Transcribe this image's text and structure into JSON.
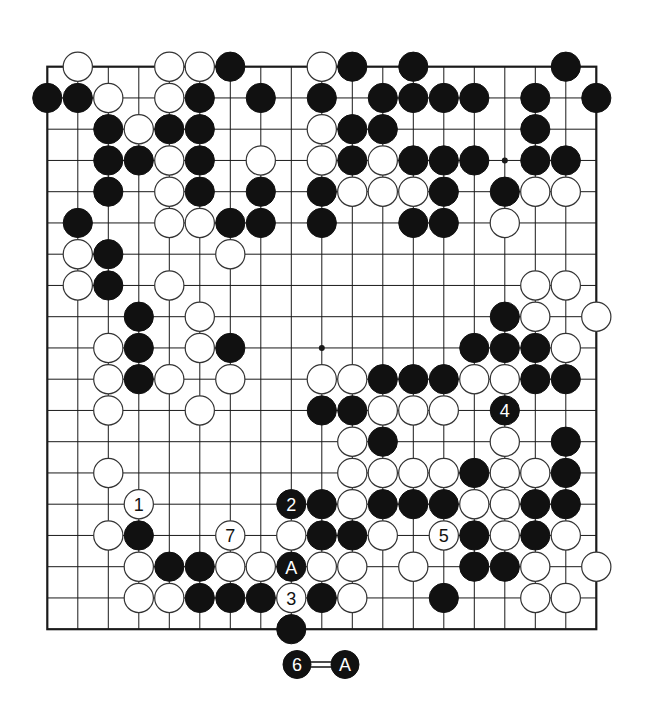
{
  "diagram": {
    "type": "go-board",
    "size": 19,
    "colors": {
      "black": "#111111",
      "white": "#ffffff",
      "line": "#1a1a1a",
      "background": "#ffffff"
    },
    "star_points": [
      [
        9,
        9
      ],
      [
        15,
        3
      ]
    ],
    "stones": [
      {
        "c": 1,
        "r": 0,
        "color": "W"
      },
      {
        "c": 4,
        "r": 0,
        "color": "W"
      },
      {
        "c": 5,
        "r": 0,
        "color": "W"
      },
      {
        "c": 6,
        "r": 0,
        "color": "B"
      },
      {
        "c": 9,
        "r": 0,
        "color": "W"
      },
      {
        "c": 10,
        "r": 0,
        "color": "B"
      },
      {
        "c": 12,
        "r": 0,
        "color": "B"
      },
      {
        "c": 17,
        "r": 0,
        "color": "B"
      },
      {
        "c": 0,
        "r": 1,
        "color": "B"
      },
      {
        "c": 1,
        "r": 1,
        "color": "B"
      },
      {
        "c": 2,
        "r": 1,
        "color": "W"
      },
      {
        "c": 4,
        "r": 1,
        "color": "W"
      },
      {
        "c": 5,
        "r": 1,
        "color": "B"
      },
      {
        "c": 7,
        "r": 1,
        "color": "B"
      },
      {
        "c": 9,
        "r": 1,
        "color": "B"
      },
      {
        "c": 11,
        "r": 1,
        "color": "B"
      },
      {
        "c": 12,
        "r": 1,
        "color": "B"
      },
      {
        "c": 13,
        "r": 1,
        "color": "B"
      },
      {
        "c": 14,
        "r": 1,
        "color": "B"
      },
      {
        "c": 16,
        "r": 1,
        "color": "B"
      },
      {
        "c": 18,
        "r": 1,
        "color": "B"
      },
      {
        "c": 2,
        "r": 2,
        "color": "B"
      },
      {
        "c": 3,
        "r": 2,
        "color": "W"
      },
      {
        "c": 4,
        "r": 2,
        "color": "B"
      },
      {
        "c": 5,
        "r": 2,
        "color": "B"
      },
      {
        "c": 9,
        "r": 2,
        "color": "W"
      },
      {
        "c": 10,
        "r": 2,
        "color": "B"
      },
      {
        "c": 11,
        "r": 2,
        "color": "B"
      },
      {
        "c": 16,
        "r": 2,
        "color": "B"
      },
      {
        "c": 2,
        "r": 3,
        "color": "B"
      },
      {
        "c": 3,
        "r": 3,
        "color": "B"
      },
      {
        "c": 4,
        "r": 3,
        "color": "W"
      },
      {
        "c": 5,
        "r": 3,
        "color": "B"
      },
      {
        "c": 7,
        "r": 3,
        "color": "W"
      },
      {
        "c": 9,
        "r": 3,
        "color": "W"
      },
      {
        "c": 10,
        "r": 3,
        "color": "B"
      },
      {
        "c": 11,
        "r": 3,
        "color": "W"
      },
      {
        "c": 12,
        "r": 3,
        "color": "B"
      },
      {
        "c": 13,
        "r": 3,
        "color": "B"
      },
      {
        "c": 14,
        "r": 3,
        "color": "B"
      },
      {
        "c": 16,
        "r": 3,
        "color": "B"
      },
      {
        "c": 17,
        "r": 3,
        "color": "B"
      },
      {
        "c": 2,
        "r": 4,
        "color": "B"
      },
      {
        "c": 4,
        "r": 4,
        "color": "W"
      },
      {
        "c": 5,
        "r": 4,
        "color": "B"
      },
      {
        "c": 7,
        "r": 4,
        "color": "B"
      },
      {
        "c": 9,
        "r": 4,
        "color": "B"
      },
      {
        "c": 10,
        "r": 4,
        "color": "W"
      },
      {
        "c": 11,
        "r": 4,
        "color": "W"
      },
      {
        "c": 12,
        "r": 4,
        "color": "W"
      },
      {
        "c": 13,
        "r": 4,
        "color": "B"
      },
      {
        "c": 15,
        "r": 4,
        "color": "B"
      },
      {
        "c": 16,
        "r": 4,
        "color": "W"
      },
      {
        "c": 17,
        "r": 4,
        "color": "W"
      },
      {
        "c": 1,
        "r": 5,
        "color": "B"
      },
      {
        "c": 4,
        "r": 5,
        "color": "W"
      },
      {
        "c": 5,
        "r": 5,
        "color": "W"
      },
      {
        "c": 6,
        "r": 5,
        "color": "B"
      },
      {
        "c": 7,
        "r": 5,
        "color": "B"
      },
      {
        "c": 9,
        "r": 5,
        "color": "B"
      },
      {
        "c": 12,
        "r": 5,
        "color": "B"
      },
      {
        "c": 13,
        "r": 5,
        "color": "B"
      },
      {
        "c": 15,
        "r": 5,
        "color": "W"
      },
      {
        "c": 1,
        "r": 6,
        "color": "W"
      },
      {
        "c": 2,
        "r": 6,
        "color": "B"
      },
      {
        "c": 6,
        "r": 6,
        "color": "W"
      },
      {
        "c": 1,
        "r": 7,
        "color": "W"
      },
      {
        "c": 2,
        "r": 7,
        "color": "B"
      },
      {
        "c": 4,
        "r": 7,
        "color": "W"
      },
      {
        "c": 16,
        "r": 7,
        "color": "W"
      },
      {
        "c": 17,
        "r": 7,
        "color": "W"
      },
      {
        "c": 3,
        "r": 8,
        "color": "B"
      },
      {
        "c": 5,
        "r": 8,
        "color": "W"
      },
      {
        "c": 15,
        "r": 8,
        "color": "B"
      },
      {
        "c": 16,
        "r": 8,
        "color": "W"
      },
      {
        "c": 18,
        "r": 8,
        "color": "W"
      },
      {
        "c": 2,
        "r": 9,
        "color": "W"
      },
      {
        "c": 3,
        "r": 9,
        "color": "B"
      },
      {
        "c": 5,
        "r": 9,
        "color": "W"
      },
      {
        "c": 6,
        "r": 9,
        "color": "B"
      },
      {
        "c": 14,
        "r": 9,
        "color": "B"
      },
      {
        "c": 15,
        "r": 9,
        "color": "B"
      },
      {
        "c": 16,
        "r": 9,
        "color": "B"
      },
      {
        "c": 17,
        "r": 9,
        "color": "W"
      },
      {
        "c": 2,
        "r": 10,
        "color": "W"
      },
      {
        "c": 3,
        "r": 10,
        "color": "B"
      },
      {
        "c": 4,
        "r": 10,
        "color": "W"
      },
      {
        "c": 6,
        "r": 10,
        "color": "W"
      },
      {
        "c": 9,
        "r": 10,
        "color": "W"
      },
      {
        "c": 10,
        "r": 10,
        "color": "W"
      },
      {
        "c": 11,
        "r": 10,
        "color": "B"
      },
      {
        "c": 12,
        "r": 10,
        "color": "B"
      },
      {
        "c": 13,
        "r": 10,
        "color": "B"
      },
      {
        "c": 14,
        "r": 10,
        "color": "W"
      },
      {
        "c": 15,
        "r": 10,
        "color": "W"
      },
      {
        "c": 16,
        "r": 10,
        "color": "B"
      },
      {
        "c": 17,
        "r": 10,
        "color": "B"
      },
      {
        "c": 2,
        "r": 11,
        "color": "W"
      },
      {
        "c": 5,
        "r": 11,
        "color": "W"
      },
      {
        "c": 9,
        "r": 11,
        "color": "B"
      },
      {
        "c": 10,
        "r": 11,
        "color": "B"
      },
      {
        "c": 11,
        "r": 11,
        "color": "W"
      },
      {
        "c": 12,
        "r": 11,
        "color": "W"
      },
      {
        "c": 13,
        "r": 11,
        "color": "W"
      },
      {
        "c": 15,
        "r": 11,
        "color": "B",
        "label": "4"
      },
      {
        "c": 10,
        "r": 12,
        "color": "W"
      },
      {
        "c": 11,
        "r": 12,
        "color": "B"
      },
      {
        "c": 15,
        "r": 12,
        "color": "W"
      },
      {
        "c": 17,
        "r": 12,
        "color": "B"
      },
      {
        "c": 2,
        "r": 13,
        "color": "W"
      },
      {
        "c": 10,
        "r": 13,
        "color": "W"
      },
      {
        "c": 11,
        "r": 13,
        "color": "W"
      },
      {
        "c": 12,
        "r": 13,
        "color": "W"
      },
      {
        "c": 13,
        "r": 13,
        "color": "W"
      },
      {
        "c": 14,
        "r": 13,
        "color": "B"
      },
      {
        "c": 15,
        "r": 13,
        "color": "W"
      },
      {
        "c": 16,
        "r": 13,
        "color": "W"
      },
      {
        "c": 17,
        "r": 13,
        "color": "B"
      },
      {
        "c": 3,
        "r": 14,
        "color": "W",
        "label": "1"
      },
      {
        "c": 8,
        "r": 14,
        "color": "B",
        "label": "2"
      },
      {
        "c": 9,
        "r": 14,
        "color": "B"
      },
      {
        "c": 10,
        "r": 14,
        "color": "W"
      },
      {
        "c": 11,
        "r": 14,
        "color": "B"
      },
      {
        "c": 12,
        "r": 14,
        "color": "B"
      },
      {
        "c": 13,
        "r": 14,
        "color": "B"
      },
      {
        "c": 14,
        "r": 14,
        "color": "W"
      },
      {
        "c": 15,
        "r": 14,
        "color": "W"
      },
      {
        "c": 16,
        "r": 14,
        "color": "B"
      },
      {
        "c": 17,
        "r": 14,
        "color": "B"
      },
      {
        "c": 2,
        "r": 15,
        "color": "W"
      },
      {
        "c": 3,
        "r": 15,
        "color": "B"
      },
      {
        "c": 6,
        "r": 15,
        "color": "W",
        "label": "7"
      },
      {
        "c": 8,
        "r": 15,
        "color": "W"
      },
      {
        "c": 9,
        "r": 15,
        "color": "B"
      },
      {
        "c": 10,
        "r": 15,
        "color": "B"
      },
      {
        "c": 11,
        "r": 15,
        "color": "W"
      },
      {
        "c": 13,
        "r": 15,
        "color": "W",
        "label": "5"
      },
      {
        "c": 14,
        "r": 15,
        "color": "B"
      },
      {
        "c": 15,
        "r": 15,
        "color": "W"
      },
      {
        "c": 16,
        "r": 15,
        "color": "B"
      },
      {
        "c": 17,
        "r": 15,
        "color": "W"
      },
      {
        "c": 3,
        "r": 16,
        "color": "W"
      },
      {
        "c": 4,
        "r": 16,
        "color": "B"
      },
      {
        "c": 5,
        "r": 16,
        "color": "B"
      },
      {
        "c": 6,
        "r": 16,
        "color": "W"
      },
      {
        "c": 7,
        "r": 16,
        "color": "W"
      },
      {
        "c": 8,
        "r": 16,
        "color": "B",
        "label": "A"
      },
      {
        "c": 9,
        "r": 16,
        "color": "W"
      },
      {
        "c": 10,
        "r": 16,
        "color": "W"
      },
      {
        "c": 12,
        "r": 16,
        "color": "W"
      },
      {
        "c": 14,
        "r": 16,
        "color": "B"
      },
      {
        "c": 15,
        "r": 16,
        "color": "B"
      },
      {
        "c": 16,
        "r": 16,
        "color": "W"
      },
      {
        "c": 18,
        "r": 16,
        "color": "W"
      },
      {
        "c": 3,
        "r": 17,
        "color": "W"
      },
      {
        "c": 4,
        "r": 17,
        "color": "W"
      },
      {
        "c": 5,
        "r": 17,
        "color": "B"
      },
      {
        "c": 6,
        "r": 17,
        "color": "B"
      },
      {
        "c": 7,
        "r": 17,
        "color": "B"
      },
      {
        "c": 8,
        "r": 17,
        "color": "W",
        "label": "3"
      },
      {
        "c": 9,
        "r": 17,
        "color": "B"
      },
      {
        "c": 10,
        "r": 17,
        "color": "W"
      },
      {
        "c": 13,
        "r": 17,
        "color": "B"
      },
      {
        "c": 16,
        "r": 17,
        "color": "W"
      },
      {
        "c": 17,
        "r": 17,
        "color": "W"
      },
      {
        "c": 8,
        "r": 18,
        "color": "B"
      }
    ],
    "caption": {
      "left": {
        "color": "B",
        "label": "6"
      },
      "connector": "=",
      "right": {
        "color": "B",
        "label": "A"
      }
    }
  }
}
